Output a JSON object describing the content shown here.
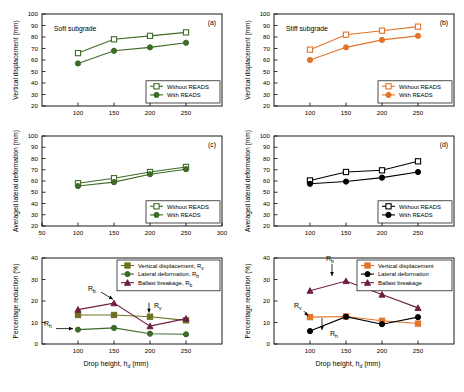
{
  "figure": {
    "width": 464,
    "height": 392,
    "caption": "",
    "xaxis_title_left": "Drop height, h",
    "xaxis_title_left_sub": "d",
    "xaxis_title_left_unit": "(mm)",
    "xaxis_title_right": "Drop height, h",
    "xaxis_title_right_sub": "d",
    "xaxis_title_right_unit": "(mm)"
  },
  "colors": {
    "green": "#3d6b28",
    "olive": "#6f7021",
    "orange": "#e2742a",
    "black": "#000000",
    "purple": "#6e1f43",
    "axis": "#000000"
  },
  "chart_data": [
    {
      "id": "a",
      "type": "line",
      "panel_label": "(a)",
      "annotation": "Soft subgrade",
      "title": "",
      "xlabel": "Drop height, hd (mm)",
      "ylabel": "Vertical displacement (mm)",
      "x": [
        100,
        150,
        200,
        250
      ],
      "xlim": [
        50,
        300
      ],
      "xticks": [
        100,
        150,
        200,
        250
      ],
      "ylim": [
        20,
        100
      ],
      "yticks": [
        20,
        30,
        40,
        50,
        60,
        70,
        80,
        90,
        100
      ],
      "grid": false,
      "legend_position": "bottom-right",
      "series": [
        {
          "name": "Without READS",
          "values": [
            66,
            78,
            81,
            84
          ],
          "color": "#3d6b28",
          "marker": "square-open"
        },
        {
          "name": "With READS",
          "values": [
            57,
            68,
            71,
            75
          ],
          "color": "#3d6b28",
          "marker": "circle-filled"
        }
      ]
    },
    {
      "id": "b",
      "type": "line",
      "panel_label": "(b)",
      "annotation": "Stiff subgrade",
      "title": "",
      "xlabel": "Drop height, hd (mm)",
      "ylabel": "Vertical displacement (mm)",
      "x": [
        100,
        150,
        200,
        250
      ],
      "xlim": [
        50,
        300
      ],
      "xticks": [
        100,
        150,
        200,
        250
      ],
      "ylim": [
        20,
        100
      ],
      "yticks": [
        20,
        30,
        40,
        50,
        60,
        70,
        80,
        90,
        100
      ],
      "grid": false,
      "legend_position": "bottom-right",
      "series": [
        {
          "name": "Without READS",
          "values": [
            69,
            82,
            85.5,
            89
          ],
          "color": "#e2742a",
          "marker": "square-open"
        },
        {
          "name": "With READS",
          "values": [
            60,
            71,
            77.5,
            81
          ],
          "color": "#e2742a",
          "marker": "circle-filled"
        }
      ]
    },
    {
      "id": "c",
      "type": "line",
      "panel_label": "(c)",
      "annotation": "",
      "title": "",
      "xlabel": "Drop height, hd (mm)",
      "ylabel": "Averaged lateral deformation (mm)",
      "x": [
        100,
        150,
        200,
        250
      ],
      "xlim": [
        50,
        300
      ],
      "xticks": [
        50,
        100,
        150,
        200,
        250,
        300
      ],
      "ylim": [
        20,
        100
      ],
      "yticks": [
        20,
        30,
        40,
        50,
        60,
        70,
        80,
        90,
        100
      ],
      "grid": false,
      "legend_position": "bottom-right",
      "series": [
        {
          "name": "Without READS",
          "values": [
            58,
            62.5,
            68,
            72.5
          ],
          "color": "#3d6b28",
          "marker": "square-open"
        },
        {
          "name": "With READS",
          "values": [
            55.5,
            59,
            66,
            70.5
          ],
          "color": "#3d6b28",
          "marker": "circle-filled"
        }
      ]
    },
    {
      "id": "d",
      "type": "line",
      "panel_label": "(d)",
      "annotation": "",
      "title": "",
      "xlabel": "Drop height, hd (mm)",
      "ylabel": "Averaged lateral deformation (mm)",
      "x": [
        100,
        150,
        200,
        250
      ],
      "xlim": [
        50,
        300
      ],
      "xticks": [
        100,
        150,
        200,
        250
      ],
      "ylim": [
        20,
        100
      ],
      "yticks": [
        20,
        30,
        40,
        50,
        60,
        70,
        80,
        90,
        100
      ],
      "grid": false,
      "legend_position": "bottom-right",
      "series": [
        {
          "name": "Without READS",
          "values": [
            60.5,
            68,
            69.5,
            77.5
          ],
          "color": "#000000",
          "marker": "square-open"
        },
        {
          "name": "With READS",
          "values": [
            57.5,
            59.5,
            63,
            68
          ],
          "color": "#000000",
          "marker": "circle-filled"
        }
      ]
    },
    {
      "id": "e",
      "type": "line",
      "panel_label": "(e)",
      "annotation": "",
      "title": "",
      "xlabel": "Drop height, hd (mm)",
      "ylabel": "Percentage reduction (%)",
      "x": [
        100,
        150,
        200,
        250
      ],
      "xlim": [
        50,
        300
      ],
      "xticks": [
        100,
        150,
        200,
        250
      ],
      "ylim": [
        0,
        40
      ],
      "yticks": [
        0,
        10,
        20,
        30,
        40
      ],
      "grid": false,
      "legend_position": "top-right",
      "annotations": [
        {
          "label": "R",
          "sub": "b",
          "x": 150,
          "y": 19
        },
        {
          "label": "R",
          "sub": "v",
          "x": 200,
          "y": 12.7
        },
        {
          "label": "R",
          "sub": "h",
          "x": 100,
          "y": 6.7
        }
      ],
      "series": [
        {
          "name": "Vertical displacement, R",
          "sub": "v",
          "values": [
            13.5,
            13.5,
            12.7,
            11
          ],
          "color": "#6f7021",
          "marker": "square-filled"
        },
        {
          "name": "Lateral deformation, R",
          "sub": "h",
          "values": [
            6.7,
            7.5,
            4.8,
            4.5
          ],
          "color": "#3d6b28",
          "marker": "circle-filled"
        },
        {
          "name": "Ballast breakage, R",
          "sub": "b",
          "values": [
            16,
            19,
            8.3,
            11.8
          ],
          "color": "#6e1f43",
          "marker": "triangle-filled"
        }
      ]
    },
    {
      "id": "f",
      "type": "line",
      "panel_label": "(f)",
      "annotation": "",
      "title": "",
      "xlabel": "Drop height, hd (mm)",
      "ylabel": "Percentage reduction (%)",
      "x": [
        100,
        150,
        200,
        250
      ],
      "xlim": [
        50,
        300
      ],
      "xticks": [
        100,
        150,
        200,
        250
      ],
      "ylim": [
        0,
        40
      ],
      "yticks": [
        0,
        10,
        20,
        30,
        40
      ],
      "grid": false,
      "legend_position": "top-right",
      "annotations": [
        {
          "label": "R",
          "sub": "b",
          "x": 150,
          "y": 29.3
        },
        {
          "label": "R",
          "sub": "v",
          "x": 100,
          "y": 12.5
        },
        {
          "label": "R",
          "sub": "h",
          "x": 125,
          "y": 0
        }
      ],
      "series": [
        {
          "name": "Vertical displacement",
          "sub": "",
          "values": [
            12.5,
            12.8,
            10.8,
            9.5
          ],
          "color": "#e2742a",
          "marker": "square-filled"
        },
        {
          "name": "Lateral deformation",
          "sub": "",
          "values": [
            6,
            12.7,
            9.2,
            12.5
          ],
          "color": "#000000",
          "marker": "circle-filled"
        },
        {
          "name": "Ballast breakage",
          "sub": "",
          "values": [
            24.8,
            29.3,
            23,
            16.8
          ],
          "color": "#6e1f43",
          "marker": "triangle-filled"
        }
      ]
    }
  ]
}
